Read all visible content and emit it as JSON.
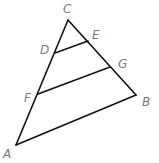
{
  "diagram": {
    "points": {
      "A": {
        "label": "A",
        "x": 16,
        "y": 145,
        "lx": 3,
        "ly": 158
      },
      "B": {
        "label": "B",
        "x": 136,
        "y": 95,
        "lx": 142,
        "ly": 106
      },
      "C": {
        "label": "C",
        "x": 68,
        "y": 20,
        "lx": 63,
        "ly": 13
      },
      "D": {
        "label": "D",
        "x": 55,
        "y": 53,
        "lx": 40,
        "ly": 54
      },
      "E": {
        "label": "E",
        "x": 88,
        "y": 41,
        "lx": 92,
        "ly": 39
      },
      "F": {
        "label": "F",
        "x": 38,
        "y": 94,
        "lx": 24,
        "ly": 102
      },
      "G": {
        "label": "G",
        "x": 110,
        "y": 67,
        "lx": 118,
        "ly": 68
      }
    },
    "segments": [
      {
        "name": "side-CA",
        "from": "C",
        "to": "A"
      },
      {
        "name": "side-CB",
        "from": "C",
        "to": "B"
      },
      {
        "name": "side-AB",
        "from": "A",
        "to": "B"
      },
      {
        "name": "segment-DE",
        "from": "D",
        "to": "E"
      },
      {
        "name": "segment-FG",
        "from": "F",
        "to": "G"
      }
    ],
    "colors": {
      "line": "#111111",
      "label": "#7a7a7a"
    }
  }
}
